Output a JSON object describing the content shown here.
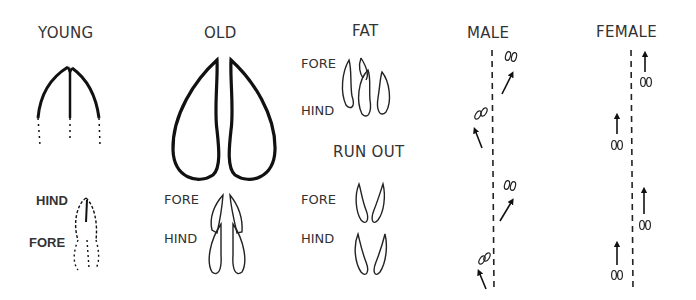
{
  "columns": [
    {
      "heading": "YOUNG",
      "sub_labels": [
        "HIND",
        "FORE"
      ]
    },
    {
      "heading": "OLD",
      "sub_labels": [
        "FORE",
        "HIND"
      ]
    },
    {
      "heading": "FAT",
      "sub_labels": [
        "FORE",
        "HIND"
      ]
    },
    {
      "heading": "RUN OUT",
      "sub_labels": [
        "FORE",
        "HIND"
      ]
    },
    {
      "heading": "MALE"
    },
    {
      "heading": "FEMALE"
    }
  ],
  "colors": {
    "ink": "#111111",
    "text": "#333333",
    "background": "#ffffff"
  }
}
